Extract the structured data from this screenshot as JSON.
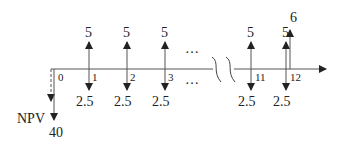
{
  "diagram": {
    "type": "cash-flow-timeline",
    "periods_shown": [
      "0",
      "1",
      "2",
      "3",
      "11",
      "12"
    ],
    "ellipsis": "…",
    "present_value_label": "NPV",
    "initial_outflow": "40",
    "flows": [
      {
        "period": "1",
        "inflow": "5",
        "outflow": "2.5"
      },
      {
        "period": "2",
        "inflow": "5",
        "outflow": "2.5"
      },
      {
        "period": "3",
        "inflow": "5",
        "outflow": "2.5"
      },
      {
        "period": "11",
        "inflow": "5",
        "outflow": "2.5"
      },
      {
        "period": "12",
        "inflow": "5",
        "outflow": "2.5",
        "extra_inflow": "6"
      }
    ],
    "colors": {
      "line": "#444444",
      "text": "#222222"
    }
  }
}
